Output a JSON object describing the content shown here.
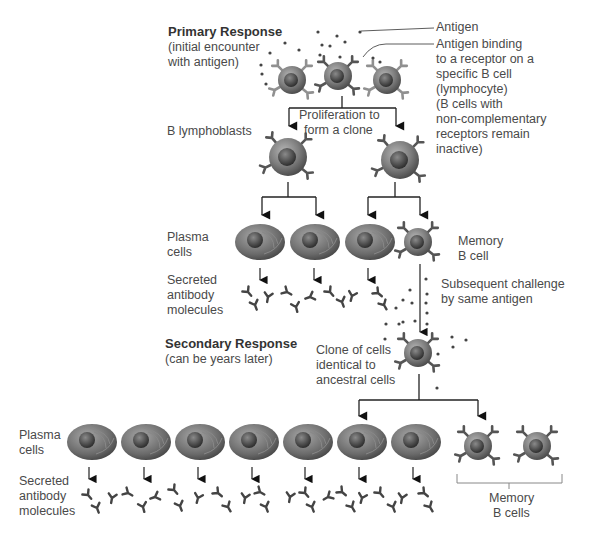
{
  "primary": {
    "title": "Primary Response",
    "subtitle_l1": "(initial encounter",
    "subtitle_l2": "with antigen)"
  },
  "labels": {
    "antigen": "Antigen",
    "binding_l1": "Antigen binding",
    "binding_l2": "to a receptor on a",
    "binding_l3": "specific B cell",
    "binding_l4": "(lymphocyte)",
    "binding_l5": "(B cells with",
    "binding_l6": "non-complementary",
    "binding_l7": "receptors remain",
    "binding_l8": "inactive)",
    "proliferation_l1": "Proliferation to",
    "proliferation_l2": "form a clone",
    "lymphoblasts": "B lymphoblasts",
    "plasma1_l1": "Plasma",
    "plasma1_l2": "cells",
    "memory1_l1": "Memory",
    "memory1_l2": "B cell",
    "secreted1_l1": "Secreted",
    "secreted1_l2": "antibody",
    "secreted1_l3": "molecules",
    "challenge_l1": "Subsequent challenge",
    "challenge_l2": "by same antigen",
    "clone_l1": "Clone of cells",
    "clone_l2": "identical to",
    "clone_l3": "ancestral cells",
    "plasma2_l1": "Plasma",
    "plasma2_l2": "cells",
    "secreted2_l1": "Secreted",
    "secreted2_l2": "antibody",
    "secreted2_l3": "molecules",
    "memory2_l1": "Memory",
    "memory2_l2": "B cells"
  },
  "secondary": {
    "title": "Secondary Response",
    "subtitle": "(can be years later)"
  },
  "colors": {
    "cell_body": "#7a7a7a",
    "nucleus": "#3e3e3e",
    "receptor": "#5a5a5a",
    "line": "#222222",
    "text": "#4a4a4a"
  }
}
